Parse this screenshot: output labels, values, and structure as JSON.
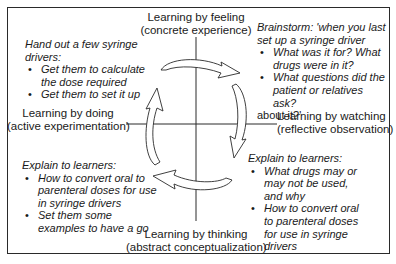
{
  "diagram": {
    "type": "experiential-learning-cycle",
    "axes": {
      "top": {
        "line1": "Learning by feeling",
        "line2": "(concrete experience)"
      },
      "right": {
        "line1": "Learning by watching",
        "line2": "(reflective observation)"
      },
      "bottom": {
        "line1": "Learning by thinking",
        "line2": "(abstract conceptualization)"
      },
      "left": {
        "line1": "Learning by doing",
        "line2": "(active experimentation)"
      }
    },
    "quadrants": {
      "top_left": {
        "heading_line1": "Hand out a few syringe",
        "heading_line2": "drivers:",
        "bullets": [
          "Get them to calculate the dose required",
          "Get them to set it up"
        ]
      },
      "top_right": {
        "heading_line1": "Brainstorm: 'when you last",
        "heading_line2": "set up a syringe driver",
        "bullets": [
          "What was it for? What drugs were in it?",
          "What questions did the patient or relatives ask?"
        ],
        "trailing_text": "about it?'"
      },
      "bottom_left": {
        "heading_line1": "Explain to learners:",
        "bullets": [
          "How to convert oral to parenteral doses for use in syringe drivers",
          "Set them some examples to have a go"
        ]
      },
      "bottom_right": {
        "heading_line1": "Explain to learners:",
        "bullets": [
          "What drugs may or may not be used, and why",
          "How to convert oral to parenteral doses for use in syringe drivers"
        ]
      }
    },
    "cycle_direction": "clockwise",
    "colors": {
      "line": "#2a2a2a",
      "arrow_fill": "#ffffff",
      "text": "#1a1a1a"
    }
  }
}
